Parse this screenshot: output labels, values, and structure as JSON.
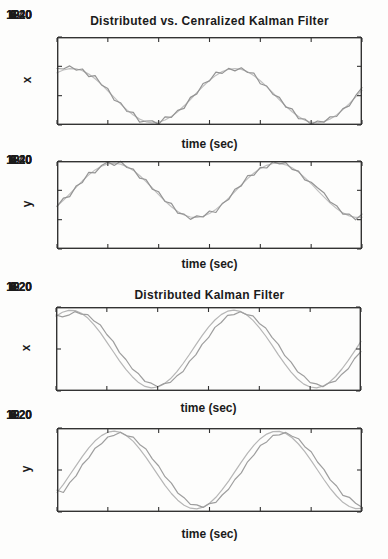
{
  "page": {
    "background": "#fdfdfc",
    "text_color": "#1b1b1b",
    "axis_color": "#333333"
  },
  "chart_data": [
    {
      "id": "centralized-vs-distributed-x",
      "type": "line",
      "title": "Distributed vs. Cenralized Kalman Filter",
      "xlabel": "time (sec)",
      "ylabel": "x",
      "xlim": [
        0,
        12
      ],
      "ylim": [
        -20,
        40
      ],
      "xticks": [
        0,
        2,
        4,
        6,
        8,
        10,
        12
      ],
      "yticks": [
        40,
        20,
        0,
        -20
      ],
      "grid": false,
      "legend": "none",
      "x_start": 0,
      "x_step": 0.25,
      "series": [
        {
          "name": "smooth-estimate-line",
          "color": "#c0c0c0",
          "values": [
            15.6,
            17.5,
            18.4,
            18.3,
            17.0,
            14.7,
            11.5,
            7.7,
            3.3,
            -1.2,
            -5.6,
            -9.7,
            -13.2,
            -16.0,
            -17.8,
            -18.5,
            -18.1,
            -16.6,
            -14.2,
            -10.9,
            -6.9,
            -2.6,
            2.0,
            6.4,
            10.4,
            13.8,
            16.4,
            18.0,
            18.5,
            17.9,
            16.3,
            13.6,
            10.2,
            6.2,
            1.8,
            -2.8,
            -7.1,
            -11.0,
            -14.3,
            -16.7,
            -18.1,
            -18.5,
            -17.7,
            -15.9,
            -13.1,
            -9.5,
            -5.4,
            -1.0,
            3.6
          ]
        },
        {
          "name": "noisy-estimate-line",
          "color": "#949494",
          "values": [
            18.5,
            18.2,
            20.3,
            17.4,
            18.2,
            13.0,
            13.6,
            7.3,
            4.8,
            -3.1,
            -4.8,
            -10.8,
            -11.4,
            -18.0,
            -17.3,
            -17.2,
            -19.6,
            -14.4,
            -14.8,
            -10.0,
            -8.7,
            -1.2,
            1.2,
            8.3,
            10.1,
            16.1,
            15.2,
            18.6,
            16.9,
            19.0,
            15.8,
            15.3,
            8.1,
            6.6,
            0.8,
            -1.2,
            -7.8,
            -9.0,
            -15.7,
            -15.9,
            -19.6,
            -17.3,
            -18.1,
            -14.4,
            -14.2,
            -8.8,
            -7.0,
            0.0,
            5.4
          ]
        }
      ]
    },
    {
      "id": "centralized-vs-distributed-y",
      "type": "line",
      "title": "",
      "xlabel": "time (sec)",
      "ylabel": "y",
      "xlim": [
        0,
        12
      ],
      "ylim": [
        -40,
        20
      ],
      "xticks": [
        0,
        2,
        4,
        6,
        8,
        10,
        12
      ],
      "yticks": [
        20,
        0,
        -20,
        -40
      ],
      "grid": false,
      "legend": "none",
      "x_start": 0,
      "x_step": 0.25,
      "series": [
        {
          "name": "smooth-estimate-line",
          "color": "#c0c0c0",
          "values": [
            -10.7,
            -6.8,
            -2.4,
            2.1,
            6.5,
            10.5,
            13.9,
            16.4,
            18.0,
            18.5,
            17.9,
            16.2,
            13.6,
            10.1,
            6.0,
            1.6,
            -2.9,
            -7.3,
            -11.2,
            -14.4,
            -16.8,
            -18.2,
            -18.5,
            -17.7,
            -15.8,
            -13.0,
            -9.4,
            -5.3,
            -0.8,
            3.7,
            8.0,
            11.8,
            14.9,
            17.1,
            18.3,
            18.4,
            17.4,
            15.4,
            12.4,
            8.7,
            4.5,
            0.0,
            -4.5,
            -8.7,
            -12.4,
            -15.4,
            -17.4,
            -18.4,
            -18.3
          ]
        },
        {
          "name": "noisy-estimate-line",
          "color": "#949494",
          "values": [
            -11.1,
            -5.3,
            -4.3,
            2.9,
            5.4,
            12.3,
            11.9,
            16.9,
            19.3,
            17.0,
            19.8,
            15.6,
            14.5,
            8.3,
            7.4,
            0.8,
            -1.0,
            -7.6,
            -8.9,
            -15.6,
            -16.2,
            -19.8,
            -17.4,
            -18.2,
            -14.1,
            -15.1,
            -9.0,
            -6.3,
            0.8,
            3.0,
            10.0,
            10.4,
            15.7,
            15.2,
            19.5,
            18.0,
            18.9,
            14.3,
            13.1,
            7.1,
            5.5,
            1.8,
            -1.6,
            -8.0,
            -10.5,
            -16.3,
            -16.2,
            -20.1,
            -16.2
          ]
        }
      ]
    },
    {
      "id": "distributed-x",
      "type": "line",
      "title": "Distributed Kalman Filter",
      "xlabel": "time (sec)",
      "ylabel": "x",
      "xlim": [
        0,
        12
      ],
      "ylim": [
        -20,
        20
      ],
      "xticks": [
        0,
        2,
        4,
        6,
        8,
        10,
        12
      ],
      "yticks": [
        20,
        0,
        -20
      ],
      "grid": false,
      "legend": "none",
      "x_start": 0,
      "x_step": 0.25,
      "series": [
        {
          "name": "state-line",
          "color": "#b6b6b6",
          "values": [
            15.6,
            17.5,
            18.4,
            18.3,
            17.0,
            14.7,
            11.5,
            7.7,
            3.3,
            -1.2,
            -5.6,
            -9.7,
            -13.2,
            -16.0,
            -17.8,
            -18.5,
            -18.1,
            -16.6,
            -14.2,
            -10.9,
            -6.9,
            -2.6,
            2.0,
            6.4,
            10.4,
            13.8,
            16.4,
            18.0,
            18.5,
            17.9,
            16.3,
            13.6,
            10.2,
            6.2,
            1.8,
            -2.8,
            -7.1,
            -11.0,
            -14.3,
            -16.7,
            -18.1,
            -18.5,
            -17.7,
            -15.9,
            -13.1,
            -9.5,
            -5.4,
            -1.0,
            3.6
          ]
        },
        {
          "name": "estimate-line",
          "color": "#9e9e9e",
          "values": [
            16.2,
            15.3,
            16.1,
            17.8,
            16.6,
            16.4,
            13.3,
            11.4,
            6.9,
            3.6,
            -1.7,
            -5.0,
            -9.5,
            -11.8,
            -15.5,
            -16.3,
            -18.0,
            -16.5,
            -15.9,
            -12.9,
            -10.7,
            -5.9,
            -2.8,
            2.2,
            5.4,
            10.3,
            12.6,
            16.0,
            16.4,
            17.7,
            16.4,
            15.8,
            12.2,
            10.0,
            5.5,
            2.2,
            -3.2,
            -6.3,
            -10.8,
            -12.8,
            -16.0,
            -16.6,
            -18.0,
            -16.1,
            -15.3,
            -12.0,
            -9.4,
            -4.5,
            -1.3
          ]
        }
      ]
    },
    {
      "id": "distributed-y",
      "type": "line",
      "title": "",
      "xlabel": "time (sec)",
      "ylabel": "y",
      "xlim": [
        0,
        12
      ],
      "ylim": [
        -20,
        20
      ],
      "xticks": [
        0,
        2,
        4,
        6,
        8,
        10,
        12
      ],
      "yticks": [
        20,
        0,
        -20
      ],
      "grid": false,
      "legend": "none",
      "x_start": 0,
      "x_step": 0.25,
      "series": [
        {
          "name": "state-line",
          "color": "#b6b6b6",
          "values": [
            -10.7,
            -6.8,
            -2.4,
            2.1,
            6.5,
            10.5,
            13.9,
            16.4,
            18.0,
            18.5,
            17.9,
            16.2,
            13.6,
            10.1,
            6.0,
            1.6,
            -2.9,
            -7.3,
            -11.2,
            -14.4,
            -16.8,
            -18.2,
            -18.5,
            -17.7,
            -15.8,
            -13.0,
            -9.4,
            -5.3,
            -0.8,
            3.7,
            8.0,
            11.8,
            14.9,
            17.1,
            18.3,
            18.4,
            17.4,
            15.4,
            12.4,
            8.7,
            4.5,
            0.0,
            -4.5,
            -8.7,
            -12.4,
            -15.4,
            -17.4,
            -18.4,
            -18.3
          ]
        },
        {
          "name": "estimate-line",
          "color": "#9e9e9e",
          "values": [
            -9.6,
            -10.7,
            -6.0,
            -2.8,
            2.6,
            5.8,
            10.4,
            12.5,
            15.7,
            16.5,
            18.0,
            16.3,
            15.6,
            12.2,
            10.0,
            5.3,
            1.9,
            -3.2,
            -6.3,
            -10.9,
            -13.2,
            -16.4,
            -16.6,
            -17.8,
            -16.0,
            -15.4,
            -11.9,
            -9.2,
            -4.5,
            -1.4,
            3.9,
            7.2,
            11.6,
            13.4,
            16.5,
            16.7,
            17.9,
            16.1,
            14.9,
            11.1,
            8.7,
            3.8,
            0.3,
            -4.7,
            -7.6,
            -12.1,
            -13.0,
            -15.8,
            -17.7
          ]
        }
      ]
    }
  ]
}
